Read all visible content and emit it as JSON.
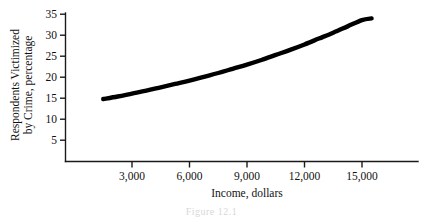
{
  "chart_data": {
    "type": "line",
    "title": "",
    "xlabel": "Income, dollars",
    "ylabel_line1": "Respondents Victimized",
    "ylabel_line2": "by Crime, percentage",
    "ylabel": "Respondents Victimized by Crime, percentage",
    "xtick_labels": [
      "3,000",
      "6,000",
      "9,000",
      "12,000",
      "15,000"
    ],
    "xticks": [
      3000,
      6000,
      9000,
      12000,
      15000
    ],
    "ytick_labels": [
      "35",
      "30",
      "25",
      "20",
      "15",
      "10",
      "5"
    ],
    "yticks": [
      35,
      30,
      25,
      20,
      15,
      10,
      5
    ],
    "xlim": [
      0,
      16800
    ],
    "ylim": [
      0,
      35
    ],
    "grid": false,
    "legend": "none",
    "series": [
      {
        "name": "Respondents victimized by crime",
        "x": [
          1500,
          2250,
          3000,
          3750,
          4500,
          5250,
          6000,
          6750,
          7500,
          8250,
          9000,
          9750,
          10500,
          11250,
          12000,
          12750,
          13500,
          14250,
          15000,
          15500
        ],
        "values": [
          14.8,
          15.4,
          16.1,
          16.8,
          17.6,
          18.4,
          19.2,
          20.1,
          21.0,
          22.0,
          23.0,
          24.1,
          25.3,
          26.5,
          27.8,
          29.2,
          30.6,
          32.1,
          33.6,
          34.0
        ]
      }
    ],
    "curve_color": "#000000",
    "axis_color": "#1a1a1a"
  },
  "caption": {
    "text": "Figure 12.1"
  }
}
